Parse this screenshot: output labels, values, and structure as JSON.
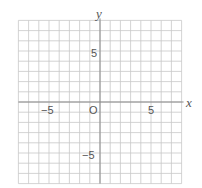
{
  "diagram": {
    "type": "coordinate-plane",
    "x_axis_label": "x",
    "y_axis_label": "y",
    "origin_label": "O",
    "x_range": [
      -8,
      8
    ],
    "y_range": [
      -8,
      8
    ],
    "grid_step": 1,
    "tick_labels": {
      "x": [
        {
          "value": -5,
          "text": "−5"
        },
        {
          "value": 5,
          "text": "5"
        }
      ],
      "y": [
        {
          "value": 5,
          "text": "5"
        },
        {
          "value": -5,
          "text": "−5"
        }
      ]
    },
    "colors": {
      "grid": "#c8c8c8",
      "axis": "#8a8a8a",
      "text": "#555555"
    }
  }
}
